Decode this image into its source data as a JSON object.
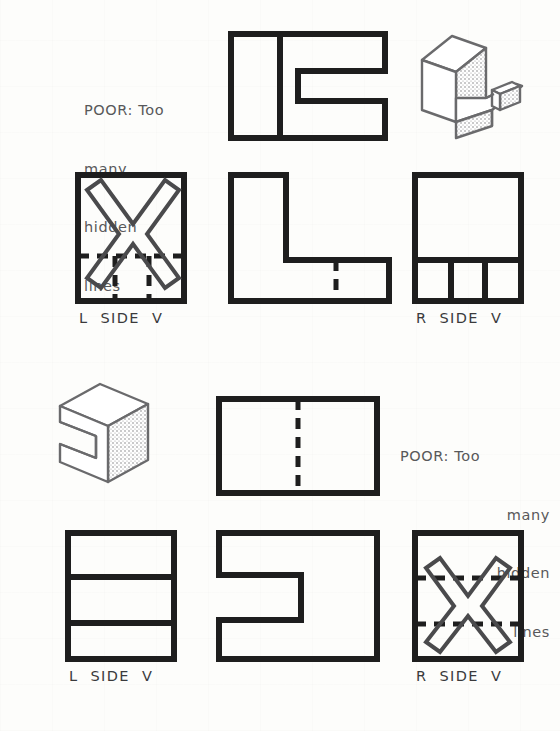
{
  "figure": {
    "line_color": "#1e1e1e",
    "note_color": "#58585a",
    "background": "#fdfdfb"
  },
  "groups": [
    {
      "id": "upper",
      "note": {
        "lines": [
          "POOR: Too",
          "many",
          "hidden",
          "lines"
        ],
        "align": "left"
      },
      "views": [
        {
          "id": "top-view",
          "name": "top-view",
          "label": "",
          "kind": "orthographic"
        },
        {
          "id": "pictorial",
          "name": "isometric-pictorial",
          "label": "",
          "kind": "isometric"
        },
        {
          "id": "left-side",
          "name": "left-side-view",
          "label": "L  SIDE  V",
          "kind": "orthographic",
          "rejected": true
        },
        {
          "id": "front",
          "name": "front-view",
          "label": "",
          "kind": "orthographic"
        },
        {
          "id": "right-side",
          "name": "right-side-view",
          "label": "R  SIDE  V",
          "kind": "orthographic",
          "rejected": false
        }
      ]
    },
    {
      "id": "lower",
      "note": {
        "lines": [
          "POOR: Too",
          "many",
          "hidden",
          "lines"
        ],
        "align": "right"
      },
      "views": [
        {
          "id": "pictorial2",
          "name": "isometric-pictorial",
          "label": "",
          "kind": "isometric"
        },
        {
          "id": "top-view2",
          "name": "top-view",
          "label": "",
          "kind": "orthographic"
        },
        {
          "id": "left-side2",
          "name": "left-side-view",
          "label": "L  SIDE  V",
          "kind": "orthographic",
          "rejected": false
        },
        {
          "id": "front2",
          "name": "front-view",
          "label": "",
          "kind": "orthographic"
        },
        {
          "id": "right-side2",
          "name": "right-side-view",
          "label": "R  SIDE  V",
          "kind": "orthographic",
          "rejected": true
        }
      ]
    }
  ],
  "labels": {
    "l_side_v": "L  SIDE  V",
    "r_side_v": "R  SIDE  V"
  },
  "notes": {
    "upper": {
      "l1": "POOR: Too",
      "l2": "many",
      "l3": "hidden",
      "l4": "lines"
    },
    "lower": {
      "l1": "POOR: Too",
      "l2": "many",
      "l3": "hidden",
      "l4": "lines"
    }
  }
}
